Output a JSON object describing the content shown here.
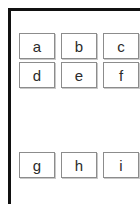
{
  "frame": {
    "top_rule_color": "#111111",
    "left_rule_color": "#111111"
  },
  "grid": {
    "cell_border_color": "#8c8c8c",
    "cell_text_color": "#2b2b2b",
    "cell_background": "#ffffff",
    "rows": [
      {
        "name": "row-1",
        "cells": [
          {
            "label": "a"
          },
          {
            "label": "b"
          },
          {
            "label": "c"
          }
        ]
      },
      {
        "name": "row-2",
        "cells": [
          {
            "label": "d"
          },
          {
            "label": "e"
          },
          {
            "label": "f"
          }
        ]
      },
      {
        "name": "row-3",
        "cells": [
          {
            "label": "g"
          },
          {
            "label": "h"
          },
          {
            "label": "i"
          }
        ]
      }
    ]
  }
}
